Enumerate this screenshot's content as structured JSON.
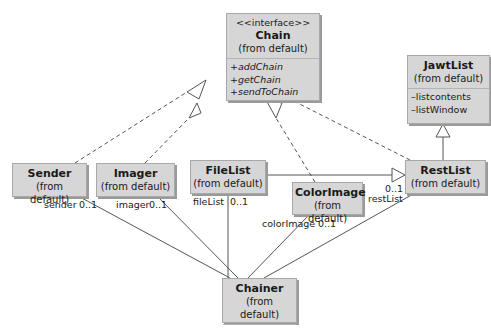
{
  "diagram": {
    "type": "UML class diagram",
    "classes": [
      {
        "id": "chain",
        "stereotype": "<<interface>>",
        "name": "Chain",
        "package": "(from default)",
        "operations": [
          "+addChain",
          "+getChain",
          "+sendToChain"
        ]
      },
      {
        "id": "jawtlist",
        "name": "JawtList",
        "package": "(from default)",
        "attributes": [
          "–listcontents",
          "–listWindow"
        ]
      },
      {
        "id": "sender",
        "name": "Sender",
        "package": "(from default)"
      },
      {
        "id": "imager",
        "name": "Imager",
        "package": "(from default)"
      },
      {
        "id": "filelist",
        "name": "FileList",
        "package": "(from default)"
      },
      {
        "id": "colorimage",
        "name": "ColorImage",
        "package": "(from default)"
      },
      {
        "id": "restlist",
        "name": "RestList",
        "package": "(from default)"
      },
      {
        "id": "chainer",
        "name": "Chainer",
        "package": "(from default)"
      }
    ],
    "relationships": [
      {
        "from": "Sender",
        "to": "Chain",
        "kind": "realization"
      },
      {
        "from": "Imager",
        "to": "Chain",
        "kind": "realization"
      },
      {
        "from": "ColorImage",
        "to": "Chain",
        "kind": "realization"
      },
      {
        "from": "RestList",
        "to": "Chain",
        "kind": "realization"
      },
      {
        "from": "RestList",
        "to": "JawtList",
        "kind": "generalization"
      },
      {
        "from": "FileList",
        "to": "RestList",
        "kind": "generalization"
      },
      {
        "from": "Chainer",
        "to": "Sender",
        "kind": "association",
        "role": "sender",
        "multiplicity": "0..1"
      },
      {
        "from": "Chainer",
        "to": "Imager",
        "kind": "association",
        "role": "imager",
        "multiplicity": "0..1"
      },
      {
        "from": "Chainer",
        "to": "FileList",
        "kind": "association",
        "role": "fileList",
        "multiplicity": "0..1"
      },
      {
        "from": "Chainer",
        "to": "ColorImage",
        "kind": "association",
        "role": "colorImage",
        "multiplicity": "0..1"
      },
      {
        "from": "Chainer",
        "to": "RestList",
        "kind": "association",
        "role": "restList",
        "multiplicity": "0..1"
      }
    ],
    "labels": {
      "sender_role": "sender",
      "sender_mult": "0..1",
      "imager_role": "imager",
      "imager_mult": "0..1",
      "filelist_role": "fileList",
      "filelist_mult": "0..1",
      "colorimage_role": "colorImage",
      "colorimage_mult": "0..1",
      "restlist_role": "restList",
      "restlist_mult": "0..1"
    }
  },
  "colors": {
    "box_fill": "#d6d6d6",
    "box_border": "#a8a8a8",
    "line": "#555555"
  }
}
